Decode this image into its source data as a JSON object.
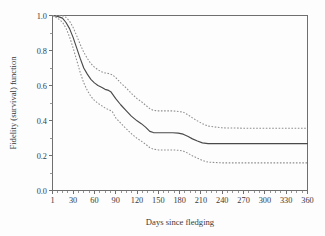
{
  "chart_data": {
    "type": "line",
    "title": "",
    "xlabel": "Days since fledging",
    "ylabel": "Fidelity (survival) function",
    "xlim": [
      1,
      360
    ],
    "ylim": [
      0.0,
      1.0
    ],
    "grid": false,
    "legend": "none",
    "x_ticks": [
      1,
      30,
      60,
      90,
      120,
      150,
      180,
      210,
      240,
      270,
      300,
      330,
      360
    ],
    "x_tick_labels": [
      "1",
      "30",
      "60",
      "90",
      "120",
      "150",
      "180",
      "210",
      "240",
      "270",
      "300",
      "330",
      "360"
    ],
    "x_minor_ticks_per_interval": 3,
    "y_ticks": [
      0.0,
      0.2,
      0.4,
      0.6,
      0.8,
      1.0
    ],
    "y_tick_labels": [
      "0.0",
      "0.2",
      "0.4",
      "0.6",
      "0.8",
      "1.0"
    ],
    "y_minor_ticks_per_interval": 1,
    "series": [
      {
        "name": "Fidelity (survival) estimate",
        "style": "solid",
        "color": "#4a4a4a",
        "x": [
          1,
          8,
          15,
          20,
          25,
          30,
          35,
          40,
          45,
          50,
          55,
          60,
          65,
          70,
          75,
          80,
          83,
          90,
          97,
          105,
          112,
          120,
          126,
          132,
          138,
          143,
          150,
          160,
          170,
          178,
          185,
          192,
          198,
          205,
          212,
          220,
          240,
          270,
          300,
          330,
          360
        ],
        "y": [
          1.0,
          0.995,
          0.985,
          0.96,
          0.925,
          0.875,
          0.815,
          0.755,
          0.7,
          0.665,
          0.635,
          0.615,
          0.6,
          0.59,
          0.578,
          0.572,
          0.565,
          0.525,
          0.49,
          0.455,
          0.425,
          0.398,
          0.382,
          0.362,
          0.338,
          0.331,
          0.33,
          0.33,
          0.33,
          0.328,
          0.322,
          0.308,
          0.295,
          0.283,
          0.272,
          0.268,
          0.268,
          0.268,
          0.268,
          0.268,
          0.268
        ]
      },
      {
        "name": "Upper 95% confidence limit",
        "style": "dotted",
        "color": "#8e8e8e",
        "x": [
          1,
          8,
          15,
          20,
          25,
          30,
          35,
          40,
          45,
          50,
          55,
          60,
          65,
          70,
          75,
          80,
          85,
          90,
          97,
          105,
          112,
          120,
          126,
          132,
          138,
          143,
          150,
          160,
          170,
          178,
          185,
          192,
          198,
          205,
          212,
          220,
          240,
          270,
          300,
          330,
          360
        ],
        "y": [
          1.0,
          1.0,
          0.998,
          0.99,
          0.968,
          0.932,
          0.885,
          0.835,
          0.79,
          0.755,
          0.725,
          0.705,
          0.69,
          0.678,
          0.672,
          0.668,
          0.662,
          0.645,
          0.615,
          0.585,
          0.555,
          0.525,
          0.508,
          0.488,
          0.468,
          0.458,
          0.455,
          0.455,
          0.455,
          0.452,
          0.448,
          0.432,
          0.415,
          0.398,
          0.382,
          0.368,
          0.358,
          0.356,
          0.356,
          0.356,
          0.356
        ]
      },
      {
        "name": "Lower 95% confidence limit",
        "style": "dotted",
        "color": "#8e8e8e",
        "x": [
          1,
          8,
          15,
          20,
          25,
          30,
          35,
          40,
          45,
          50,
          55,
          60,
          65,
          70,
          75,
          80,
          85,
          90,
          97,
          105,
          112,
          120,
          126,
          132,
          138,
          143,
          150,
          160,
          170,
          178,
          185,
          192,
          198,
          205,
          212,
          220,
          240,
          270,
          300,
          330,
          360
        ],
        "y": [
          1.0,
          0.985,
          0.962,
          0.928,
          0.878,
          0.815,
          0.745,
          0.675,
          0.615,
          0.572,
          0.538,
          0.515,
          0.498,
          0.485,
          0.472,
          0.462,
          0.452,
          0.415,
          0.385,
          0.352,
          0.325,
          0.298,
          0.282,
          0.265,
          0.245,
          0.236,
          0.232,
          0.232,
          0.232,
          0.23,
          0.226,
          0.212,
          0.198,
          0.185,
          0.172,
          0.162,
          0.158,
          0.158,
          0.158,
          0.158,
          0.158
        ]
      }
    ]
  },
  "axes": {
    "y_title": "Fidelity (survival) function",
    "x_title": "Days since fledging"
  },
  "colors": {
    "axis": "#6f6f6f",
    "main_curve": "#4a4a4a",
    "ci_curve": "#8e8e8e",
    "background": "#fdfdfd",
    "text": "#3a3a3a"
  }
}
